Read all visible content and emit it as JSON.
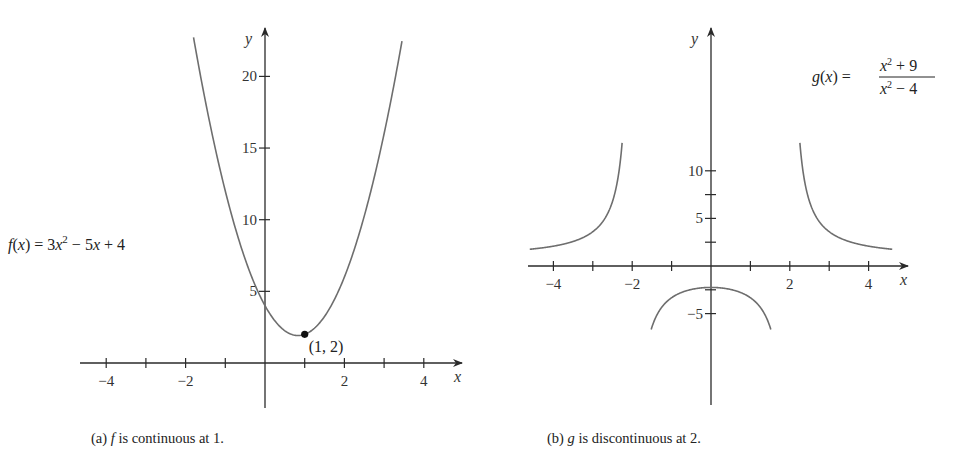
{
  "chart_data": [
    {
      "type": "line",
      "id": "a",
      "title": "",
      "caption_prefix": "(a)",
      "caption_var": "f",
      "caption_text": "is continuous at 1.",
      "xlabel": "x",
      "ylabel": "y",
      "function": "3x^2 - 5x + 4",
      "equation_label": {
        "lhs": "f(x) = 3x",
        "exp": "2",
        "rhs": " − 5x + 4"
      },
      "coefficients": [
        3,
        -5,
        4
      ],
      "x_domain": [
        -1.8,
        3.45
      ],
      "xlim": [
        -4.5,
        4.9
      ],
      "ylim": [
        -2,
        23
      ],
      "x_ticks": [
        -4,
        -3,
        -2,
        -1,
        1,
        2,
        3,
        4
      ],
      "x_tick_labels": [
        {
          "value": -4,
          "label": "−4"
        },
        {
          "value": -2,
          "label": "−2"
        },
        {
          "value": 2,
          "label": "2"
        },
        {
          "value": 4,
          "label": "4"
        }
      ],
      "y_ticks": [
        5,
        10,
        15,
        20
      ],
      "y_tick_labels": [
        {
          "value": 5,
          "label": "5"
        },
        {
          "value": 10,
          "label": "10"
        },
        {
          "value": 15,
          "label": "15"
        },
        {
          "value": 20,
          "label": "20"
        }
      ],
      "highlight_point": {
        "x": 1,
        "y": 2,
        "label": "(1, 2)"
      },
      "grid": false
    },
    {
      "type": "line",
      "id": "b",
      "title": "",
      "caption_prefix": "(b)",
      "caption_var": "g",
      "caption_text": "is discontinuous at 2.",
      "xlabel": "x",
      "ylabel": "y",
      "function": "(x^2 + 9) / (x^2 - 4)",
      "equation_label": {
        "lhs": "g(x) = ",
        "num": "x² + 9",
        "den": "x² − 4"
      },
      "vertical_asymptotes": [
        -2,
        2
      ],
      "branches": [
        {
          "x_domain": [
            -4.6,
            -2.2
          ]
        },
        {
          "x_domain": [
            -1.57,
            1.57
          ]
        },
        {
          "x_domain": [
            2.2,
            4.6
          ]
        }
      ],
      "xlim": [
        -4.7,
        4.9
      ],
      "ylim": [
        -7,
        12
      ],
      "x_ticks": [
        -4,
        -3,
        -2,
        -1,
        1,
        2,
        3,
        4
      ],
      "x_tick_labels": [
        {
          "value": -4,
          "label": "−4"
        },
        {
          "value": -2,
          "label": "−2"
        },
        {
          "value": 2,
          "label": "2"
        },
        {
          "value": 4,
          "label": "4"
        }
      ],
      "y_ticks": [
        -5,
        -2.5,
        2.5,
        5,
        7.5,
        10
      ],
      "y_tick_labels": [
        {
          "value": -5,
          "label": "−5"
        },
        {
          "value": 5,
          "label": "5"
        },
        {
          "value": 10,
          "label": "10"
        }
      ],
      "grid": false
    }
  ]
}
